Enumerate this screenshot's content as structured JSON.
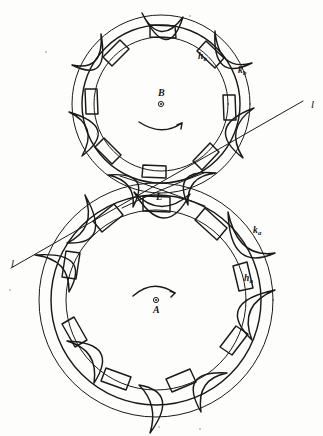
{
  "figure": {
    "background_color": "#fdfdfc",
    "ink_color": "#1a1a18",
    "width": 323,
    "height": 436
  },
  "gears": [
    {
      "id": "gear-b",
      "center_label": "B",
      "position": "upper",
      "center": {
        "x": 161,
        "y": 104
      },
      "rotation_label": "counterclockwise",
      "rotation_arrow": "arc-arrow-ccw",
      "tooth_count": 8,
      "pitch_radius": 85,
      "circles": [
        {
          "name": "pitch-circle",
          "radius": 85
        },
        {
          "name": "addendum-circle",
          "radius": 74,
          "label": "h_b"
        },
        {
          "name": "root-circle",
          "radius": 66
        },
        {
          "name": "outer-circle",
          "radius": 92,
          "label": "k_b"
        }
      ],
      "labels": [
        {
          "name": "addendum-label",
          "base": "h",
          "sub": "b"
        },
        {
          "name": "outer-label",
          "base": "k",
          "sub": "b"
        }
      ]
    },
    {
      "id": "gear-a",
      "center_label": "A",
      "position": "lower",
      "center": {
        "x": 156,
        "y": 300
      },
      "rotation_label": "clockwise",
      "rotation_arrow": "arc-arrow-cw",
      "tooth_count": 9,
      "pitch_radius": 110,
      "circles": [
        {
          "name": "pitch-circle",
          "radius": 110
        },
        {
          "name": "addendum-circle",
          "radius": 98,
          "label": "h_a"
        },
        {
          "name": "root-circle",
          "radius": 88
        },
        {
          "name": "outer-circle",
          "radius": 118,
          "label": "k_a"
        }
      ],
      "labels": [
        {
          "name": "addendum-label",
          "base": "h",
          "sub": "a"
        },
        {
          "name": "outer-label",
          "base": "k",
          "sub": "a"
        }
      ]
    }
  ],
  "pitch_point": {
    "name": "pitch-point",
    "label": "L",
    "x": 161,
    "y": 189,
    "description": "tangency point of the two pitch circles"
  },
  "tangent_line": {
    "name": "line-of-action",
    "label": "l",
    "start": {
      "x": 11,
      "y": 268
    },
    "end": {
      "x": 305,
      "y": 100
    },
    "label_positions": [
      {
        "name": "line-label-left",
        "text": "l",
        "x": 12,
        "y": 258
      },
      {
        "name": "line-label-right",
        "text": "l",
        "x": 310,
        "y": 100
      }
    ]
  },
  "labels": {
    "center_b": "B",
    "center_a": "A",
    "pitch_point": "L",
    "line_left": "l",
    "line_right": "l",
    "hb_base": "h",
    "hb_sub": "b",
    "kb_base": "k",
    "kb_sub": "b",
    "ha_base": "h",
    "ha_sub": "a",
    "ka_base": "k",
    "ka_sub": "a"
  }
}
